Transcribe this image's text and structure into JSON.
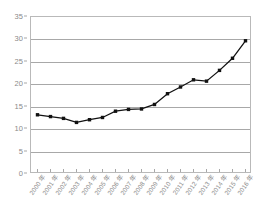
{
  "chart_data": {
    "type": "line",
    "title": "",
    "subtitle": "",
    "xlabel": "",
    "ylabel": "",
    "categories": [
      "2000 年",
      "2001 年",
      "2002 年",
      "2003 年",
      "2004 年",
      "2005 年",
      "2006 年",
      "2007 年",
      "2008 年",
      "2009 年",
      "2010 年",
      "2011 年",
      "2012 年",
      "2013 年",
      "2014 年",
      "2015 年",
      "2016 年"
    ],
    "values": [
      13.2,
      12.8,
      12.4,
      11.5,
      12.1,
      12.6,
      14.0,
      14.4,
      14.5,
      15.5,
      17.9,
      19.4,
      21.0,
      20.7,
      23.1,
      25.8,
      29.7
    ],
    "series": [
      {
        "name": "",
        "values": [
          13.2,
          12.8,
          12.4,
          11.5,
          12.1,
          12.6,
          14.0,
          14.4,
          14.5,
          15.5,
          17.9,
          19.4,
          21.0,
          20.7,
          23.1,
          25.8,
          29.7
        ]
      }
    ],
    "ylim": [
      0,
      35
    ],
    "yticks": [
      0,
      5,
      10,
      15,
      20,
      25,
      30,
      35
    ],
    "ytick_labels": [
      "0",
      "5",
      "10",
      "15",
      "20",
      "25",
      "30",
      "35"
    ],
    "grid": true,
    "grid_axis": "y",
    "legend": false,
    "legend_position": "none",
    "marker": "square",
    "line_color": "#111111",
    "marker_color": "#111111",
    "grid_color": "#a8a8a8",
    "axis_label_color": "#8a8a8a",
    "plot_border_color": "#b9b9b9",
    "background_color": "#ffffff",
    "annotations": []
  }
}
